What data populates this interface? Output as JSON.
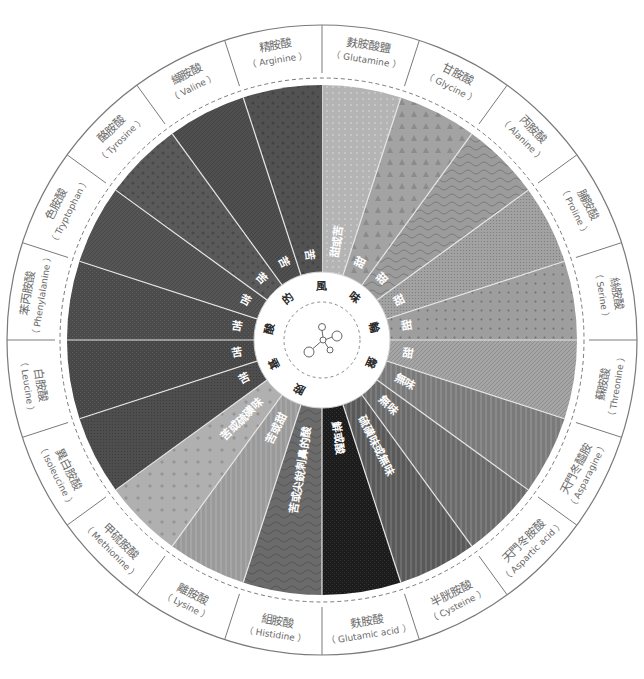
{
  "title": {
    "text": "胺基酸的風味輪盤",
    "chars": [
      "胺",
      "基",
      "酸",
      "的",
      "風",
      "味",
      "輪",
      "盤"
    ]
  },
  "center_icon": "molecule-icon",
  "segments": [
    {
      "zh": "麩胺酸鹽",
      "en": "Glutamine",
      "taste": "甜或苦",
      "color": "#b4b4b4",
      "pattern": "dots"
    },
    {
      "zh": "甘胺酸",
      "en": "Glycine",
      "taste": "甜",
      "color": "#a3a3a3",
      "pattern": "triangles"
    },
    {
      "zh": "丙胺酸",
      "en": "Alanine",
      "taste": "甜",
      "color": "#9c9c9c",
      "pattern": "waves"
    },
    {
      "zh": "脯胺酸",
      "en": "Proline",
      "taste": "甜",
      "color": "#a2a2a2",
      "pattern": "fine-dots"
    },
    {
      "zh": "絲胺酸",
      "en": "Serine",
      "taste": "甜",
      "color": "#9e9e9e",
      "pattern": "sparse-dots"
    },
    {
      "zh": "蘇胺酸",
      "en": "Threonine",
      "taste": "甜",
      "color": "#a5a5a5",
      "pattern": "hatch"
    },
    {
      "zh": "天門冬醯胺",
      "en": "Asparagine",
      "taste": "無味",
      "color": "#7a7a7a",
      "pattern": "stripes"
    },
    {
      "zh": "天門冬胺酸",
      "en": "Aspartic acid",
      "taste": "無味",
      "color": "#6a6a6a",
      "pattern": "stripes"
    },
    {
      "zh": "半胱胺酸",
      "en": "Cysteine",
      "taste": "硫磺味或無味",
      "color": "#595959",
      "pattern": "stripes"
    },
    {
      "zh": "麩胺酸",
      "en": "Glutamic acid",
      "taste": "鮮或酸",
      "color": "#1c1c1c",
      "pattern": "noise"
    },
    {
      "zh": "組胺酸",
      "en": "Histidine",
      "taste": "苦或尖銳刺鼻的酸",
      "color": "#6b6b6b",
      "pattern": "waves"
    },
    {
      "zh": "離胺酸",
      "en": "Lysine",
      "taste": "苦或甜",
      "color": "#9a9a9a",
      "pattern": "stripes"
    },
    {
      "zh": "甲硫胺酸",
      "en": "Methionine",
      "taste": "苦或硫磺味",
      "color": "#b0b0b0",
      "pattern": "crosses"
    },
    {
      "zh": "異白胺酸",
      "en": "Isoleucine",
      "taste": "苦",
      "color": "#4e4e4e",
      "pattern": "fine-dots"
    },
    {
      "zh": "白胺酸",
      "en": "Leucine",
      "taste": "苦",
      "color": "#474747",
      "pattern": "noise"
    },
    {
      "zh": "苯丙胺酸",
      "en": "Phenylalanine",
      "taste": "苦",
      "color": "#4b4b4b",
      "pattern": "noise"
    },
    {
      "zh": "色胺酸",
      "en": "Tryptophan",
      "taste": "苦",
      "color": "#555555",
      "pattern": "hatch"
    },
    {
      "zh": "酪胺酸",
      "en": "Tyrosine",
      "taste": "苦",
      "color": "#5a5a5a",
      "pattern": "spots"
    },
    {
      "zh": "纈胺酸",
      "en": "Valine",
      "taste": "苦",
      "color": "#4f4f4f",
      "pattern": "hatch"
    },
    {
      "zh": "精胺酸",
      "en": "Arginine",
      "taste": "苦",
      "color": "#525252",
      "pattern": "spots"
    }
  ],
  "colors": {
    "ring_stroke": "#7a7a7a",
    "divider": "#e6e6e6",
    "label_text": "#6a6a6a",
    "background": "#ffffff"
  }
}
